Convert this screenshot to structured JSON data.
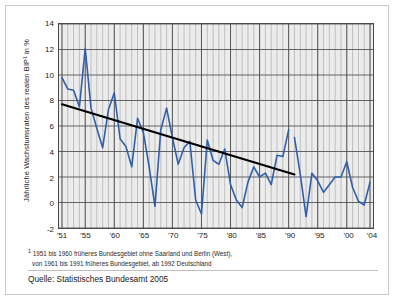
{
  "chart_data": {
    "type": "line",
    "title": "",
    "xlabel": "",
    "ylabel": "Jährliche Wachstumsraten des realen BIP¹ in %",
    "ylim": [
      -2,
      14
    ],
    "xlim": [
      1951,
      2004
    ],
    "yticks": [
      -2,
      0,
      2,
      4,
      6,
      8,
      10,
      12,
      14
    ],
    "xtick_labels": [
      "'51",
      "'55",
      "'60",
      "'65",
      "'70",
      "'75",
      "'80",
      "'85",
      "'90",
      "'95",
      "'00",
      "'04"
    ],
    "xtick_values": [
      1951,
      1955,
      1960,
      1965,
      1970,
      1975,
      1980,
      1985,
      1990,
      1995,
      2000,
      2004
    ],
    "grid": true,
    "legend_position": "none",
    "series": [
      {
        "name": "Jährliche Wachstumsrate des realen BIP",
        "color": "#2f5fa8",
        "x": [
          1951,
          1952,
          1953,
          1954,
          1955,
          1956,
          1957,
          1958,
          1959,
          1960,
          1961,
          1962,
          1963,
          1964,
          1965,
          1966,
          1967,
          1968,
          1969,
          1970,
          1971,
          1972,
          1973,
          1974,
          1975,
          1976,
          1977,
          1978,
          1979,
          1980,
          1981,
          1982,
          1983,
          1984,
          1985,
          1986,
          1987,
          1988,
          1989,
          1990,
          1991,
          1992,
          1993,
          1994,
          1995,
          1996,
          1997,
          1998,
          1999,
          2000,
          2001,
          2002,
          2003,
          2004
        ],
        "values": [
          9.8,
          8.9,
          8.8,
          7.5,
          12.1,
          7.4,
          5.8,
          4.3,
          7.3,
          8.6,
          5.0,
          4.4,
          2.8,
          6.6,
          5.5,
          2.8,
          -0.3,
          5.7,
          7.4,
          5.1,
          3.0,
          4.3,
          4.8,
          0.2,
          -0.9,
          4.9,
          3.3,
          3.0,
          4.2,
          1.4,
          0.2,
          -0.4,
          1.6,
          2.8,
          2.0,
          2.3,
          1.4,
          3.7,
          3.6,
          5.7,
          5.1,
          2.2,
          -1.1,
          2.3,
          1.7,
          0.8,
          1.4,
          2.0,
          2.0,
          3.2,
          1.2,
          0.1,
          -0.2,
          1.6
        ],
        "break_after": 1990
      },
      {
        "name": "Trendlinie",
        "color": "#000000",
        "type": "trend",
        "x": [
          1951,
          1991
        ],
        "values": [
          7.7,
          2.2
        ]
      }
    ]
  },
  "footnote": {
    "marker": "1",
    "line1": "1951 bis 1960 früheres Bundesgebiet ohne Saarland und Berlin (West),",
    "line2": "von 1961 bis 1991 früheres Bundesgebiet, ab 1992 Deutschland"
  },
  "source": {
    "text": "Quelle: Statistisches Bundesamt 2005"
  }
}
